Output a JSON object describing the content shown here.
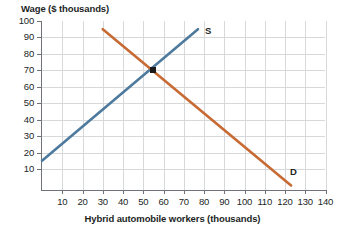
{
  "chart_data": {
    "type": "line",
    "title": "",
    "ylabel": "Wage ($ thousands)",
    "xlabel": "Hybrid automobile workers (thousands)",
    "xlim": [
      0,
      145
    ],
    "ylim": [
      0,
      103
    ],
    "grid": true,
    "legend_position": "inline-endpoint-labels",
    "xticks": [
      10,
      20,
      30,
      40,
      50,
      60,
      70,
      80,
      90,
      100,
      110,
      120,
      130,
      140
    ],
    "xtick_labels": [
      "10",
      "20",
      "30",
      "40",
      "50",
      "60",
      "70",
      "80",
      "90",
      "100",
      "110",
      "120",
      "130",
      "140"
    ],
    "yticks": [
      10,
      20,
      30,
      40,
      50,
      60,
      70,
      80,
      90,
      100
    ],
    "ytick_labels": [
      "10",
      "20",
      "30",
      "40",
      "50",
      "60",
      "70",
      "80",
      "90",
      "100"
    ],
    "series": [
      {
        "name": "S",
        "label": "S",
        "role": "supply",
        "color": "#4e7a9e",
        "points": [
          [
            0,
            15
          ],
          [
            77,
            95
          ]
        ],
        "x": [
          0,
          77
        ],
        "values": [
          15,
          95
        ]
      },
      {
        "name": "D",
        "label": "D",
        "role": "demand",
        "color": "#c86a33",
        "points": [
          [
            30,
            95
          ],
          [
            123,
            0
          ]
        ],
        "x": [
          30,
          123
        ],
        "values": [
          95,
          0
        ]
      }
    ],
    "annotations": [
      {
        "name": "equilibrium",
        "type": "point-marker",
        "x": 55,
        "y": 70,
        "color": "#1a1a1a",
        "label": ""
      }
    ]
  },
  "labels": {
    "supply_label": "S",
    "demand_label": "D"
  },
  "colors": {
    "supply": "#4e7a9e",
    "demand": "#c86a33",
    "grid": "#d7d8da",
    "axis": "#6f7277",
    "marker": "#1a1a1a",
    "text": "#221f1f"
  }
}
